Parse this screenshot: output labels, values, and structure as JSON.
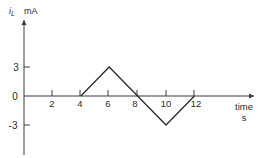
{
  "chart_data": {
    "type": "line",
    "title": "",
    "xlabel": "time",
    "xunit": "s",
    "ylabel": "i",
    "ylabel_subscript": "L",
    "yunit": "mA",
    "x_ticks": [
      2,
      4,
      6,
      8,
      10,
      12
    ],
    "y_ticks": [
      3,
      0,
      -3
    ],
    "xlim": [
      0,
      16
    ],
    "ylim": [
      -5.5,
      6.5
    ],
    "grid": false,
    "legend": null,
    "series": [
      {
        "name": "i_L",
        "x": [
          4,
          6,
          8,
          10,
          12
        ],
        "y": [
          0,
          3,
          0,
          -3,
          0
        ]
      }
    ]
  },
  "axes": {
    "y_tick_labels": [
      "3",
      "0",
      "-3"
    ],
    "x_tick_labels": [
      "2",
      "4",
      "6",
      "8",
      "10",
      "12"
    ],
    "ylabel_main": "i",
    "ylabel_sub": "L",
    "yunit": "mA",
    "xlabel": "time",
    "xunit": "s"
  },
  "colors": {
    "line": "#2a2a2a",
    "axis": "#3a3a3a",
    "background": "#ffffff"
  }
}
